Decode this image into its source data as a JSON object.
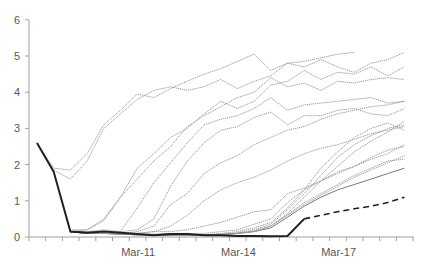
{
  "chart_data": {
    "type": "line",
    "title": "",
    "xlabel": "",
    "ylabel": "",
    "ylim": [
      0,
      6
    ],
    "yticks": [
      "0",
      "1",
      "2",
      "3",
      "4",
      "5",
      "6"
    ],
    "x_tick_labels": [
      {
        "index": 6,
        "label": "Mar-11"
      },
      {
        "index": 12,
        "label": "Mar-14"
      },
      {
        "index": 18,
        "label": "Mar-17"
      }
    ],
    "n_points": 23,
    "grid": false,
    "legend": null,
    "series": [
      {
        "name": "bold",
        "style": "solid-bold",
        "values": [
          2.6,
          1.8,
          0.15,
          0.12,
          0.15,
          0.12,
          0.08,
          0.05,
          0.08,
          0.08,
          0.05,
          0.05,
          0.03,
          0.03,
          0.02,
          0.03,
          0.5
        ]
      },
      {
        "name": "projection",
        "style": "dashed",
        "start_index": 16,
        "values": [
          0.5,
          0.6,
          0.7,
          0.78,
          0.85,
          0.95,
          1.1
        ]
      },
      {
        "name": "s1",
        "style": "dotted",
        "values": [
          2.6,
          1.9,
          1.85,
          2.3,
          3.1,
          3.5,
          3.95,
          3.85,
          4.1,
          4.3,
          4.5,
          4.65,
          4.85,
          5.05,
          4.6,
          4.8,
          4.85,
          4.95,
          5.05,
          5.1
        ]
      },
      {
        "name": "s2",
        "style": "dotted",
        "values": [
          2.6,
          1.85,
          1.6,
          2.1,
          3.0,
          3.4,
          3.8,
          4.05,
          4.15,
          4.05,
          4.15,
          4.35,
          4.1,
          4.3,
          4.45,
          4.8,
          4.7,
          4.9,
          4.7,
          4.55,
          4.8,
          4.9,
          5.1
        ]
      },
      {
        "name": "s3",
        "style": "dotted",
        "values": [
          null,
          null,
          0.2,
          0.2,
          0.45,
          1.1,
          1.9,
          2.3,
          2.75,
          3.0,
          3.4,
          3.75,
          3.55,
          3.75,
          4.2,
          4.3,
          4.6,
          4.35,
          4.55,
          4.5,
          4.7,
          4.45,
          4.7
        ]
      },
      {
        "name": "s4",
        "style": "dotted",
        "values": [
          null,
          null,
          0.15,
          0.2,
          0.5,
          1.1,
          1.6,
          2.1,
          2.5,
          3.05,
          3.35,
          3.6,
          3.85,
          4.0,
          4.4,
          4.15,
          4.25,
          4.05,
          4.3,
          4.25,
          4.35,
          4.4,
          4.35
        ]
      },
      {
        "name": "s5",
        "style": "dotted",
        "values": [
          null,
          null,
          0.15,
          0.15,
          0.2,
          0.15,
          0.8,
          1.5,
          2.05,
          2.6,
          3.1,
          3.25,
          3.35,
          3.55,
          3.85,
          3.5,
          3.65,
          3.7,
          3.75,
          3.8,
          3.85,
          3.7,
          3.75
        ]
      },
      {
        "name": "s6",
        "style": "dotted",
        "values": [
          null,
          null,
          0.15,
          0.15,
          0.15,
          0.15,
          0.2,
          0.5,
          1.4,
          2.1,
          2.6,
          2.95,
          3.05,
          3.3,
          3.45,
          3.1,
          3.35,
          3.35,
          3.5,
          3.55,
          3.4,
          3.35,
          3.55
        ]
      },
      {
        "name": "s7",
        "style": "dotted",
        "values": [
          null,
          null,
          0.15,
          0.1,
          0.1,
          0.1,
          0.15,
          0.3,
          0.9,
          1.2,
          1.75,
          2.05,
          2.25,
          2.55,
          2.75,
          2.95,
          3.05,
          3.25,
          3.4,
          3.5,
          3.6,
          3.65,
          3.75
        ]
      },
      {
        "name": "s8",
        "style": "dotted",
        "values": [
          null,
          null,
          0.15,
          0.1,
          0.1,
          0.1,
          0.1,
          0.15,
          0.3,
          0.6,
          1.0,
          1.3,
          1.5,
          1.65,
          1.85,
          2.1,
          2.3,
          2.45,
          2.55,
          2.7,
          2.85,
          2.95,
          3.05
        ]
      },
      {
        "name": "s9",
        "style": "dotted",
        "values": [
          null,
          null,
          0.15,
          0.1,
          0.1,
          0.1,
          0.1,
          0.15,
          0.15,
          0.2,
          0.3,
          0.4,
          0.55,
          0.7,
          0.75,
          1.2,
          1.35,
          1.55,
          1.75,
          1.95,
          2.15,
          2.3,
          2.55
        ]
      },
      {
        "name": "s10",
        "style": "dotted",
        "values": [
          null,
          null,
          0.15,
          0.1,
          0.1,
          0.1,
          0.08,
          0.08,
          0.1,
          0.1,
          0.1,
          0.15,
          0.2,
          0.35,
          0.5,
          0.95,
          1.3,
          1.55,
          1.8,
          1.95,
          2.2,
          2.4,
          2.5
        ]
      },
      {
        "name": "s11",
        "style": "dotted",
        "values": [
          null,
          null,
          0.15,
          0.1,
          0.1,
          0.08,
          0.06,
          0.06,
          0.06,
          0.06,
          0.06,
          0.1,
          0.15,
          0.25,
          0.4,
          0.8,
          1.3,
          1.9,
          2.35,
          2.75,
          3.0,
          3.15,
          2.95
        ]
      },
      {
        "name": "s12",
        "style": "dotted",
        "values": [
          null,
          null,
          0.15,
          0.1,
          0.1,
          0.08,
          0.06,
          0.05,
          0.05,
          0.05,
          0.05,
          0.08,
          0.12,
          0.2,
          0.35,
          0.75,
          1.2,
          1.7,
          2.2,
          2.55,
          2.8,
          3.0,
          3.1
        ]
      },
      {
        "name": "s13",
        "style": "dotted",
        "values": [
          null,
          null,
          0.15,
          0.1,
          0.1,
          0.08,
          0.06,
          0.05,
          0.05,
          0.05,
          0.05,
          0.08,
          0.1,
          0.18,
          0.3,
          0.65,
          1.1,
          1.55,
          1.95,
          2.35,
          2.65,
          2.9,
          3.2
        ]
      },
      {
        "name": "s14",
        "style": "solid-thin",
        "values": [
          null,
          null,
          0.15,
          0.1,
          0.1,
          0.08,
          0.06,
          0.05,
          0.05,
          0.05,
          0.05,
          0.06,
          0.1,
          0.15,
          0.25,
          0.55,
          0.85,
          1.1,
          1.3,
          1.45,
          1.6,
          1.75,
          1.9
        ]
      },
      {
        "name": "s15",
        "style": "dotted",
        "values": [
          null,
          null,
          0.15,
          0.1,
          0.1,
          0.08,
          0.06,
          0.05,
          0.05,
          0.05,
          0.05,
          0.06,
          0.1,
          0.15,
          0.3,
          0.6,
          0.9,
          1.15,
          1.4,
          1.65,
          1.85,
          2.05,
          2.25
        ]
      },
      {
        "name": "s16",
        "style": "dotted",
        "values": [
          null,
          null,
          0.15,
          0.1,
          0.1,
          0.08,
          0.06,
          0.05,
          0.05,
          0.05,
          0.05,
          0.06,
          0.1,
          0.15,
          0.3,
          0.62,
          0.95,
          1.2,
          1.45,
          1.7,
          1.9,
          2.1,
          2.15
        ]
      }
    ]
  },
  "layout": {
    "x0": 37,
    "dx": 16.7,
    "y_zero": 237,
    "y_unit": 36.2,
    "axis_x_left": 29,
    "axis_x_right": 414
  },
  "colors": {
    "axis": "#a0a0a0",
    "tick_label": "#595959",
    "thin_line": "#9a9a9a",
    "bold_line": "#202020"
  }
}
